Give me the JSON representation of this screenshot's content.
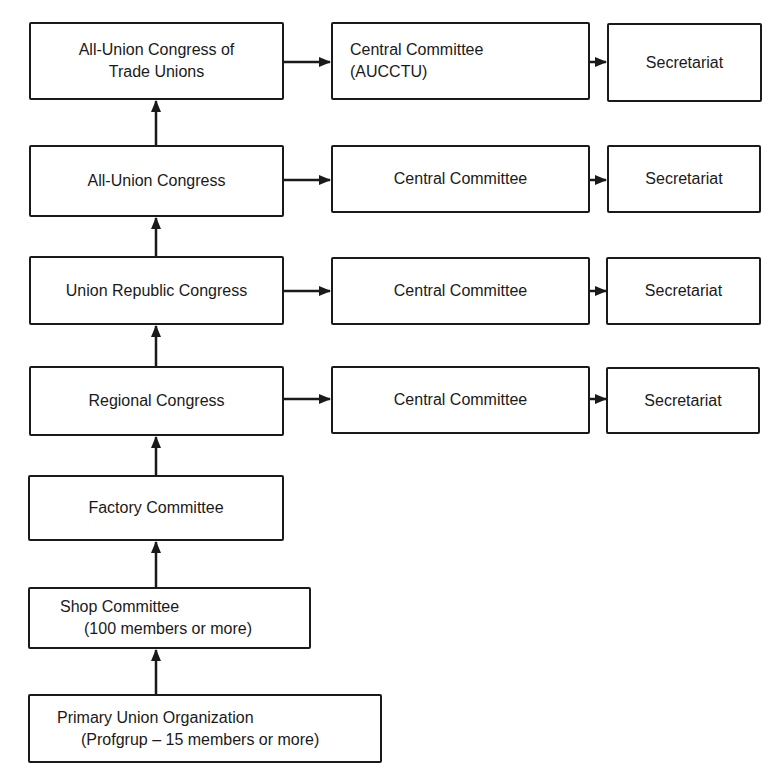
{
  "diagram": {
    "type": "organizational-hierarchy",
    "left_column": [
      {
        "id": "aucctu-congress",
        "lines": [
          "All-Union Congress of",
          "Trade Unions"
        ]
      },
      {
        "id": "all-union-congress",
        "lines": [
          "All-Union Congress"
        ]
      },
      {
        "id": "union-republic-congress",
        "lines": [
          "Union Republic Congress"
        ]
      },
      {
        "id": "regional-congress",
        "lines": [
          "Regional Congress"
        ]
      },
      {
        "id": "factory-committee",
        "lines": [
          "Factory Committee"
        ]
      },
      {
        "id": "shop-committee",
        "lines": [
          "Shop Committee",
          "(100 members or more)"
        ]
      },
      {
        "id": "primary-union-organization",
        "lines": [
          "Primary Union Organization",
          "(Profgrup – 15 members or more)"
        ]
      }
    ],
    "middle_column": [
      {
        "id": "central-committee-aucctu",
        "lines": [
          "Central Committee",
          "(AUCCTU)"
        ]
      },
      {
        "id": "central-committee-all-union",
        "lines": [
          "Central Committee"
        ]
      },
      {
        "id": "central-committee-union-republic",
        "lines": [
          "Central Committee"
        ]
      },
      {
        "id": "central-committee-regional",
        "lines": [
          "Central Committee"
        ]
      }
    ],
    "right_column": [
      {
        "id": "secretariat-aucctu",
        "lines": [
          "Secretariat"
        ]
      },
      {
        "id": "secretariat-all-union",
        "lines": [
          "Secretariat"
        ]
      },
      {
        "id": "secretariat-union-republic",
        "lines": [
          "Secretariat"
        ]
      },
      {
        "id": "secretariat-regional",
        "lines": [
          "Secretariat"
        ]
      }
    ],
    "edges": [
      {
        "from": "primary-union-organization",
        "to": "shop-committee"
      },
      {
        "from": "shop-committee",
        "to": "factory-committee"
      },
      {
        "from": "factory-committee",
        "to": "regional-congress"
      },
      {
        "from": "regional-congress",
        "to": "union-republic-congress"
      },
      {
        "from": "union-republic-congress",
        "to": "all-union-congress"
      },
      {
        "from": "all-union-congress",
        "to": "aucctu-congress"
      },
      {
        "from": "aucctu-congress",
        "to": "central-committee-aucctu"
      },
      {
        "from": "central-committee-aucctu",
        "to": "secretariat-aucctu"
      },
      {
        "from": "all-union-congress",
        "to": "central-committee-all-union"
      },
      {
        "from": "central-committee-all-union",
        "to": "secretariat-all-union"
      },
      {
        "from": "union-republic-congress",
        "to": "central-committee-union-republic"
      },
      {
        "from": "central-committee-union-republic",
        "to": "secretariat-union-republic"
      },
      {
        "from": "regional-congress",
        "to": "central-committee-regional"
      },
      {
        "from": "central-committee-regional",
        "to": "secretariat-regional"
      }
    ]
  }
}
